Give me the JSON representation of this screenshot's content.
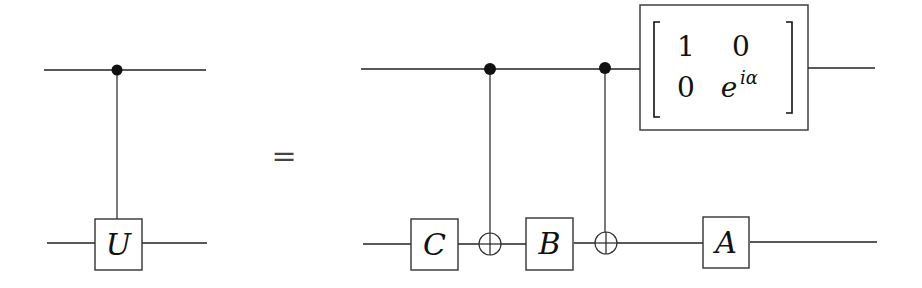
{
  "diagram": {
    "type": "quantum-circuit-identity",
    "equals_sign": "=",
    "left_circuit": {
      "description": "Controlled-U gate",
      "gates": [
        {
          "label": "U",
          "type": "controlled",
          "target_qubit": 2
        }
      ]
    },
    "right_circuit": {
      "gates": [
        {
          "label": "C",
          "qubit": 2
        },
        {
          "type": "CNOT",
          "control_qubit": 1,
          "target_qubit": 2
        },
        {
          "label": "B",
          "qubit": 2
        },
        {
          "type": "CNOT",
          "control_qubit": 1,
          "target_qubit": 2
        },
        {
          "label": "A",
          "qubit": 2
        },
        {
          "type": "phase-matrix",
          "qubit": 1,
          "matrix": [
            [
              "1",
              "0"
            ],
            [
              "0",
              "e^{iα}"
            ]
          ]
        }
      ]
    },
    "labels": {
      "U": "U",
      "C": "C",
      "B": "B",
      "A": "A",
      "m11": "1",
      "m12": "0",
      "m21": "0",
      "m22_base": "e",
      "m22_sup": "iα"
    }
  }
}
